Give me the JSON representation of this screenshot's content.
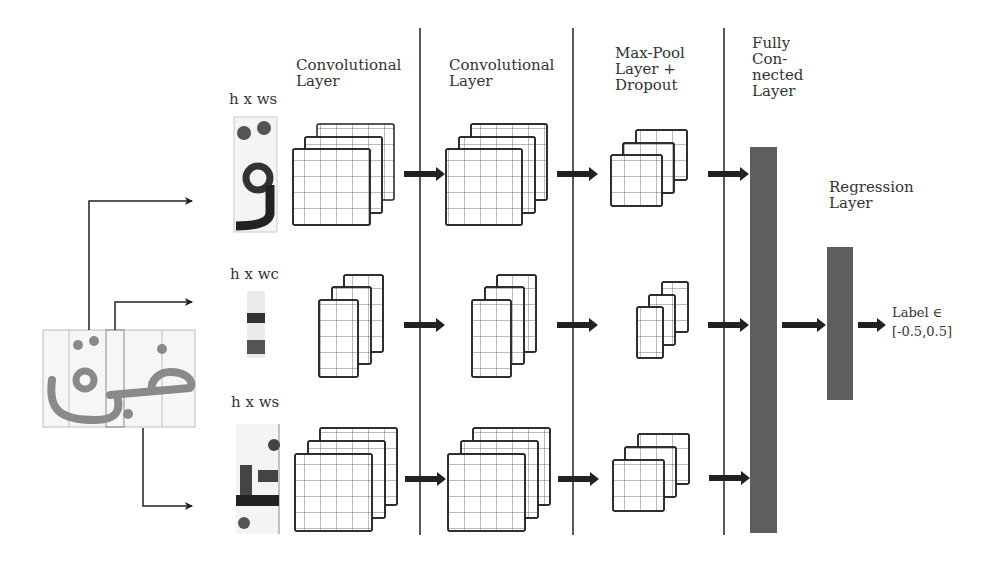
{
  "figure": {
    "colors": {
      "stroke": "#222222",
      "bar_fill": "#5e5e5e",
      "input_ink": "#8a8a8a",
      "background": "#ffffff"
    }
  },
  "columns": {
    "conv1": {
      "title_line1": "Convolutional",
      "title_line2": "Layer"
    },
    "conv2": {
      "title_line1": "Convolutional",
      "title_line2": "Layer"
    },
    "pool": {
      "title_line1": "Max-Pool",
      "title_line2": "Layer +",
      "title_line3": "Dropout"
    },
    "fc": {
      "title_line1": "Fully",
      "title_line2": "Con-",
      "title_line3": "nected",
      "title_line4": "Layer"
    },
    "regression": {
      "title_line1": "Regression",
      "title_line2": "Layer"
    }
  },
  "branches": [
    {
      "name": "top",
      "dim_label": "h x ws"
    },
    {
      "name": "middle",
      "dim_label": "h x wc"
    },
    {
      "name": "bottom",
      "dim_label": "h x ws"
    }
  ],
  "output": {
    "line1": "Label ∈",
    "line2": "[-0.5,0.5]"
  }
}
